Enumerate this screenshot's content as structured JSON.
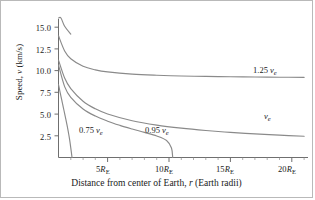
{
  "figure": {
    "background": "#ffffff",
    "border_color": "#b9b9b9",
    "curve_color": "#8a8a8a",
    "axis_color": "#6f6f6f"
  },
  "axes": {
    "ylabel_prefix": "Speed, ",
    "ylabel_var": "v",
    "ylabel_units": " (km/s)",
    "xlabel_part1": "Distance from center of Earth, ",
    "xlabel_var": "r",
    "xlabel_part2": " (Earth radii)",
    "yticks": [
      "2.5",
      "5.0",
      "7.5",
      "10.0",
      "12.5",
      "15.0"
    ],
    "xtick_values": [
      "5",
      "10",
      "15",
      "20"
    ],
    "xtick_unit": "R",
    "xtick_sub": "E"
  },
  "curve_labels": {
    "c075_coef": "0.75 ",
    "c075_var": "v",
    "c075_sub": "e",
    "c095_coef": "0.95 ",
    "c095_var": "v",
    "c095_sub": "e",
    "c100_var": "v",
    "c100_sub": "e",
    "c125_coef": "1.25 ",
    "c125_var": "v",
    "c125_sub": "e"
  },
  "chart_data": {
    "type": "line",
    "title": "",
    "xlabel": "Distance from center of Earth, r (Earth radii)",
    "ylabel": "Speed, v (km/s)",
    "xlim": [
      1,
      21.5
    ],
    "ylim": [
      0,
      16.5
    ],
    "xticks": [
      5,
      10,
      15,
      20
    ],
    "yticks": [
      2.5,
      5.0,
      7.5,
      10.0,
      12.5,
      15.0
    ],
    "grid": false,
    "legend": "inline-annotations",
    "x_unit": "Earth radii (R_E)",
    "y_unit": "km/s",
    "escape_velocity_kms": 11.2,
    "series": [
      {
        "name": "0.75 v_e",
        "launch_fraction": 0.75,
        "v0": 8.4,
        "annotation": "0.75 v_e",
        "x": [
          1.0,
          1.1,
          1.2,
          1.3,
          1.4,
          1.5,
          1.6,
          1.7,
          1.8,
          1.9,
          2.0,
          2.1,
          2.2,
          2.28
        ],
        "y": [
          8.4,
          7.71,
          7.04,
          6.38,
          5.72,
          5.06,
          4.39,
          3.69,
          2.94,
          2.12,
          1.11,
          0.0,
          0.0,
          0.0
        ]
      },
      {
        "name": "0.95 v_e",
        "launch_fraction": 0.95,
        "v0": 10.64,
        "annotation": "0.95 v_e",
        "x": [
          1.0,
          1.5,
          2.0,
          3.0,
          4.0,
          5.0,
          6.0,
          7.0,
          8.0,
          9.0,
          9.8,
          10.2,
          10.3
        ],
        "y": [
          10.64,
          8.16,
          6.93,
          5.59,
          4.77,
          4.18,
          3.7,
          3.28,
          2.89,
          2.48,
          1.96,
          1.1,
          0.0
        ]
      },
      {
        "name": "v_e",
        "launch_fraction": 1.0,
        "v0": 11.2,
        "annotation": "v_e",
        "x": [
          1.0,
          1.5,
          2.0,
          3.0,
          4.0,
          5.0,
          7.0,
          9.0,
          11.0,
          13.0,
          15.0,
          17.0,
          19.0,
          21.0
        ],
        "y": [
          11.2,
          9.14,
          7.92,
          6.47,
          5.6,
          5.01,
          4.23,
          3.73,
          3.38,
          3.11,
          2.89,
          2.72,
          2.57,
          2.44
        ]
      },
      {
        "name": "1.25 v_e",
        "launch_fraction": 1.25,
        "v0": 14.0,
        "annotation": "1.25 v_e",
        "x": [
          1.0,
          1.5,
          2.0,
          3.0,
          4.0,
          5.0,
          7.0,
          9.0,
          11.0,
          13.0,
          15.0,
          17.0,
          19.0,
          21.0
        ],
        "y": [
          14.0,
          12.26,
          11.37,
          10.5,
          10.09,
          9.85,
          9.59,
          9.46,
          9.38,
          9.33,
          9.29,
          9.26,
          9.24,
          9.22
        ]
      },
      {
        "name": "upper partial (off-top)",
        "launch_fraction": null,
        "v0": null,
        "annotation": "",
        "x": [
          1.0,
          1.2,
          1.5,
          2.0
        ],
        "y": [
          17.5,
          16.2,
          15.1,
          14.2
        ]
      }
    ]
  }
}
